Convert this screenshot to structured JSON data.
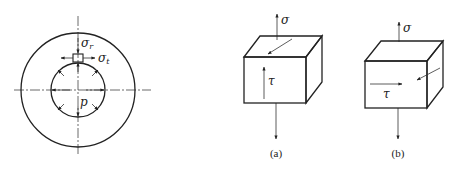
{
  "figure": {
    "colors": {
      "stroke": "#222222",
      "background": "#ffffff"
    }
  },
  "cylinder": {
    "labels": {
      "radial_stress": "σ",
      "radial_stress_sub": "r",
      "tangential_stress": "σ",
      "tangential_stress_sub": "t",
      "pressure": "p"
    }
  },
  "element_a": {
    "normal_stress": "σ",
    "shear_stress": "τ",
    "caption": "(a)"
  },
  "element_b": {
    "normal_stress": "σ",
    "shear_stress": "τ",
    "caption": "(b)"
  }
}
